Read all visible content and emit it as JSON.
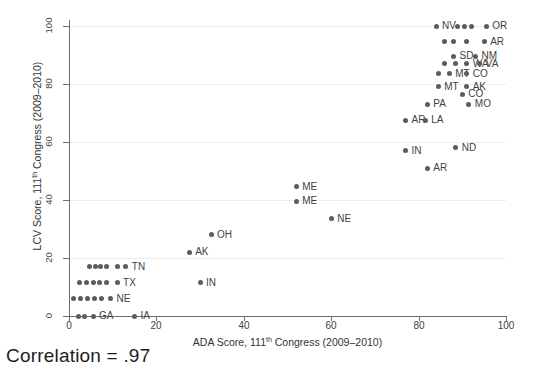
{
  "chart_data": {
    "type": "scatter",
    "title": "",
    "xlabel": "ADA Score, 111th Congress (2009–2010)",
    "xlabel_pre": "ADA Score, 111",
    "xlabel_sup": "th",
    "xlabel_post": " Congress (2009–2010)",
    "ylabel": "LCV Score, 111th Congress (2009–2010)",
    "ylabel_pre": "LCV Score, 111",
    "ylabel_sup": "th",
    "ylabel_post": " Congress (2009–2010)",
    "xlim": [
      0,
      100
    ],
    "ylim": [
      0,
      100
    ],
    "xticks": [
      0,
      20,
      40,
      60,
      80,
      100
    ],
    "yticks": [
      0,
      20,
      40,
      60,
      80,
      100
    ],
    "grid": "horizontal",
    "legend": "none",
    "marker_color": "#5c5c5c",
    "annotation": "Correlation = .97",
    "points": [
      {
        "label": "NV",
        "x": 84.0,
        "y": 100.0,
        "lx": 6
      },
      {
        "label": "",
        "x": 89.0,
        "y": 100.0,
        "lx": 6
      },
      {
        "label": "",
        "x": 90.5,
        "y": 100.0,
        "lx": 6
      },
      {
        "label": "",
        "x": 92.0,
        "y": 100.0,
        "lx": 6
      },
      {
        "label": "OR",
        "x": 95.5,
        "y": 100.0,
        "lx": 6
      },
      {
        "label": "",
        "x": 86.0,
        "y": 94.5,
        "lx": 6
      },
      {
        "label": "",
        "x": 88.0,
        "y": 94.5,
        "lx": 6
      },
      {
        "label": "",
        "x": 91.0,
        "y": 94.5,
        "lx": 6
      },
      {
        "label": "AR",
        "x": 95.0,
        "y": 94.5,
        "lx": 6
      },
      {
        "label": "SD",
        "x": 88.0,
        "y": 89.5,
        "lx": 6
      },
      {
        "label": "NM",
        "x": 93.0,
        "y": 89.5,
        "lx": 6
      },
      {
        "label": "",
        "x": 86.0,
        "y": 87.0,
        "lx": 6
      },
      {
        "label": "",
        "x": 88.5,
        "y": 87.0,
        "lx": 6
      },
      {
        "label": "WA",
        "x": 91.0,
        "y": 87.0,
        "lx": 6
      },
      {
        "label": "VA",
        "x": 94.0,
        "y": 87.0,
        "lx": 6
      },
      {
        "label": "",
        "x": 84.5,
        "y": 83.5,
        "lx": 6
      },
      {
        "label": "MT",
        "x": 87.0,
        "y": 83.5,
        "lx": 6
      },
      {
        "label": "CO",
        "x": 91.0,
        "y": 83.5,
        "lx": 6
      },
      {
        "label": "MT",
        "x": 84.5,
        "y": 79.0,
        "lx": 6
      },
      {
        "label": "AK",
        "x": 91.0,
        "y": 79.0,
        "lx": 6
      },
      {
        "label": "CO",
        "x": 90.0,
        "y": 76.5,
        "lx": 6
      },
      {
        "label": "PA",
        "x": 82.0,
        "y": 73.0,
        "lx": 6
      },
      {
        "label": "MO",
        "x": 91.5,
        "y": 73.0,
        "lx": 6
      },
      {
        "label": "AR",
        "x": 77.0,
        "y": 67.5,
        "lx": 6
      },
      {
        "label": "LA",
        "x": 81.5,
        "y": 67.5,
        "lx": 6
      },
      {
        "label": "IN",
        "x": 77.0,
        "y": 57.0,
        "lx": 6
      },
      {
        "label": "ND",
        "x": 88.5,
        "y": 58.0,
        "lx": 6
      },
      {
        "label": "AR",
        "x": 82.0,
        "y": 51.0,
        "lx": 6
      },
      {
        "label": "ME",
        "x": 52.0,
        "y": 44.5,
        "lx": 6
      },
      {
        "label": "ME",
        "x": 52.0,
        "y": 39.5,
        "lx": 6
      },
      {
        "label": "NE",
        "x": 60.0,
        "y": 33.5,
        "lx": 6
      },
      {
        "label": "OH",
        "x": 32.5,
        "y": 28.0,
        "lx": 6
      },
      {
        "label": "AK",
        "x": 27.5,
        "y": 22.0,
        "lx": 6
      },
      {
        "label": "",
        "x": 4.8,
        "y": 17.0,
        "lx": 6
      },
      {
        "label": "",
        "x": 6.0,
        "y": 17.0,
        "lx": 6
      },
      {
        "label": "",
        "x": 7.2,
        "y": 17.0,
        "lx": 6
      },
      {
        "label": "",
        "x": 8.6,
        "y": 17.0,
        "lx": 6
      },
      {
        "label": "",
        "x": 11.0,
        "y": 17.0,
        "lx": 6
      },
      {
        "label": "TN",
        "x": 13.0,
        "y": 17.0,
        "lx": 6
      },
      {
        "label": "",
        "x": 2.4,
        "y": 11.5,
        "lx": 6
      },
      {
        "label": "",
        "x": 4.0,
        "y": 11.5,
        "lx": 6
      },
      {
        "label": "",
        "x": 5.5,
        "y": 11.5,
        "lx": 6
      },
      {
        "label": "",
        "x": 7.0,
        "y": 11.5,
        "lx": 6
      },
      {
        "label": "",
        "x": 8.5,
        "y": 11.5,
        "lx": 6
      },
      {
        "label": "TX",
        "x": 11.0,
        "y": 11.5,
        "lx": 6
      },
      {
        "label": "IN",
        "x": 30.0,
        "y": 11.5,
        "lx": 6
      },
      {
        "label": "",
        "x": 1.0,
        "y": 6.0,
        "lx": 6
      },
      {
        "label": "",
        "x": 2.6,
        "y": 6.0,
        "lx": 6
      },
      {
        "label": "",
        "x": 4.2,
        "y": 6.0,
        "lx": 6
      },
      {
        "label": "",
        "x": 5.8,
        "y": 6.0,
        "lx": 6
      },
      {
        "label": "",
        "x": 7.4,
        "y": 6.0,
        "lx": 6
      },
      {
        "label": "NE",
        "x": 9.5,
        "y": 6.0,
        "lx": 6
      },
      {
        "label": "",
        "x": 2.2,
        "y": 0.0,
        "lx": 6
      },
      {
        "label": "",
        "x": 3.6,
        "y": 0.0,
        "lx": 6
      },
      {
        "label": "GA",
        "x": 5.5,
        "y": 0.0,
        "lx": 6
      },
      {
        "label": "IA",
        "x": 15.0,
        "y": 0.0,
        "lx": 6
      }
    ]
  },
  "footer": {
    "correlation_text": "Correlation = .97"
  }
}
